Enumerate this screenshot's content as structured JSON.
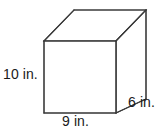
{
  "figure": {
    "kind": "rectangular-prism",
    "stroke_color": "#3a3a3a",
    "fill_color": "#ffffff",
    "background_color": "#ffffff",
    "text_color": "#1a1a1a",
    "stroke_width": 1.1,
    "geometry": {
      "front_face": {
        "top_left": [
          44,
          41
        ],
        "top_right": [
          116,
          41
        ],
        "bottom_right": [
          116,
          113
        ],
        "bottom_left": [
          44,
          113
        ]
      },
      "depth_offset": [
        30,
        -31
      ],
      "back_top_left": [
        74,
        10
      ],
      "back_top_right": [
        146,
        10
      ],
      "back_bottom_right": [
        146,
        99
      ]
    },
    "labels": {
      "height": "10 in.",
      "width": "9 in.",
      "depth": "6 in."
    },
    "dimensions": {
      "height_value": 10,
      "width_value": 9,
      "depth_value": 6,
      "unit": "in."
    }
  }
}
